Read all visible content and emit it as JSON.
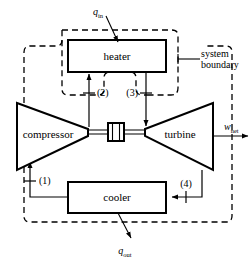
{
  "diagram": {
    "devices": {
      "heater": "heater",
      "compressor": "compressor",
      "turbine": "turbine",
      "cooler": "cooler"
    },
    "heat_flows": {
      "q_in_symbol": "q",
      "q_in_subscript": "in",
      "q_out_symbol": "q",
      "q_out_subscript": "out"
    },
    "work_flow": {
      "w_net_symbol": "w",
      "w_net_subscript": "net"
    },
    "state_points": {
      "one": "(1)",
      "two": "(2)",
      "three": "(3)",
      "four": "(4)"
    },
    "boundary_label": {
      "line1": "system",
      "line2": "boundary"
    },
    "colors": {
      "stroke": "#000000",
      "background": "#ffffff"
    }
  }
}
